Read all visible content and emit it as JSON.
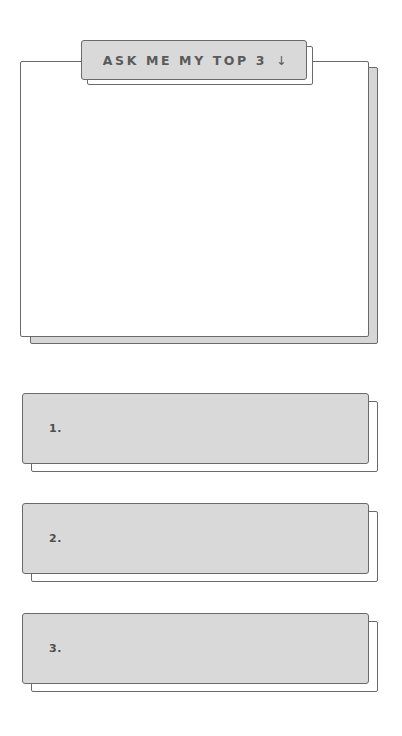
{
  "header": {
    "title": "ASK ME MY TOP 3",
    "arrow_icon": "↓"
  },
  "main_panel": {
    "content": ""
  },
  "items": [
    {
      "label": "1.",
      "value": ""
    },
    {
      "label": "2.",
      "value": ""
    },
    {
      "label": "3.",
      "value": ""
    }
  ],
  "colors": {
    "card_fill": "#d9d9d9",
    "border": "#6a6a6a",
    "text": "#5a5a5a",
    "background": "#ffffff"
  }
}
